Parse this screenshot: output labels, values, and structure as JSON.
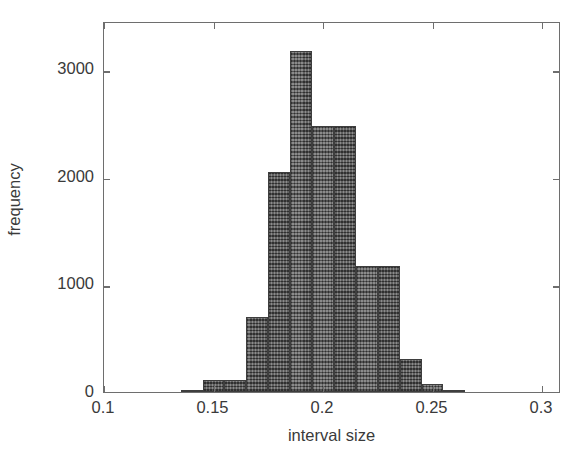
{
  "chart_data": {
    "type": "bar",
    "title": "",
    "subtitle": "",
    "xlabel": "interval size",
    "ylabel": "frequency",
    "xlim": [
      0.1,
      0.3
    ],
    "ylim": [
      0,
      3450
    ],
    "xticks": [
      0.1,
      0.15,
      0.2,
      0.25,
      0.3
    ],
    "xtick_labels": [
      "0.1",
      "0.15",
      "0.2",
      "0.25",
      "0.3"
    ],
    "yticks": [
      0,
      1000,
      2000,
      3000
    ],
    "ytick_labels": [
      "0",
      "1000",
      "2000",
      "3000"
    ],
    "grid": false,
    "legend": null,
    "bin_width": 0.01,
    "bin_edges": [
      0.125,
      0.135,
      0.145,
      0.155,
      0.165,
      0.175,
      0.185,
      0.195,
      0.205,
      0.215,
      0.225,
      0.235,
      0.245,
      0.255,
      0.265,
      0.275
    ],
    "categories": [
      "0.125-0.135",
      "0.135-0.145",
      "0.145-0.155",
      "0.155-0.165",
      "0.165-0.175",
      "0.175-0.185",
      "0.185-0.195",
      "0.195-0.205",
      "0.205-0.215",
      "0.215-0.225",
      "0.225-0.235",
      "0.235-0.245",
      "0.245-0.255",
      "0.255-0.265",
      "0.265-0.275"
    ],
    "bin_centers": [
      0.13,
      0.14,
      0.15,
      0.16,
      0.17,
      0.18,
      0.19,
      0.2,
      0.21,
      0.22,
      0.23,
      0.24,
      0.25,
      0.26,
      0.27
    ],
    "values": [
      10,
      20,
      110,
      110,
      700,
      2050,
      3170,
      2470,
      2470,
      1170,
      1170,
      310,
      70,
      20,
      10
    ],
    "bars": [
      {
        "x0": 0.135,
        "x1": 0.145,
        "value": 20
      },
      {
        "x0": 0.145,
        "x1": 0.155,
        "value": 110
      },
      {
        "x0": 0.155,
        "x1": 0.165,
        "value": 110
      },
      {
        "x0": 0.165,
        "x1": 0.175,
        "value": 700
      },
      {
        "x0": 0.175,
        "x1": 0.185,
        "value": 2050
      },
      {
        "x0": 0.185,
        "x1": 0.195,
        "value": 3170
      },
      {
        "x0": 0.195,
        "x1": 0.205,
        "value": 2470
      },
      {
        "x0": 0.205,
        "x1": 0.215,
        "value": 2470
      },
      {
        "x0": 0.215,
        "x1": 0.225,
        "value": 1170
      },
      {
        "x0": 0.225,
        "x1": 0.235,
        "value": 1170
      },
      {
        "x0": 0.235,
        "x1": 0.245,
        "value": 310
      },
      {
        "x0": 0.245,
        "x1": 0.255,
        "value": 70
      },
      {
        "x0": 0.255,
        "x1": 0.265,
        "value": 20
      }
    ],
    "bar_color": "#5e5e5e",
    "bar_edge_color": "#3e3e3e",
    "axis_color": "#6e6e6e",
    "text_color": "#3a3a3a",
    "background": "#ffffff"
  }
}
